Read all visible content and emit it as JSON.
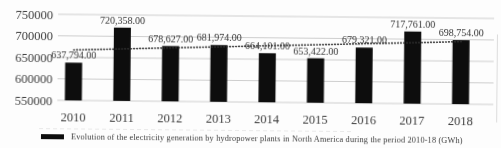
{
  "chart_data": {
    "type": "bar",
    "legend": "Evolution of the electricity generation by hydropower plants in North America during the period 2010-18 (GWh)",
    "legend_position": "bottom",
    "categories": [
      "2010",
      "2011",
      "2012",
      "2013",
      "2014",
      "2015",
      "2016",
      "2017",
      "2018"
    ],
    "values": [
      637794,
      720358,
      678627,
      681974,
      664101,
      653422,
      679321,
      717761,
      698754
    ],
    "value_labels": [
      "637,794.00",
      "720,358.00",
      "678,627.00",
      "681,974.00",
      "664,101.00",
      "653,422.00",
      "679,321.00",
      "717,761.00",
      "698,754.00"
    ],
    "xlabel": "",
    "ylabel": "",
    "ylim": [
      550000,
      750000
    ],
    "ytick_step": 50000,
    "yticks": [
      750000,
      700000,
      650000,
      600000,
      550000
    ],
    "ytick_labels": [
      "750000",
      "700000",
      "650000",
      "600000",
      "550000"
    ],
    "grid": true,
    "trendline": {
      "style": "dotted",
      "start_value": 667400,
      "end_value": 695300
    },
    "colors": {
      "bar": "#0d0d0d",
      "grid": "#c8c8c8",
      "text": "#3d3d3d",
      "value_text": "#333333",
      "trend": "#2e2e2e",
      "artifact": "#dcdcdc"
    }
  }
}
